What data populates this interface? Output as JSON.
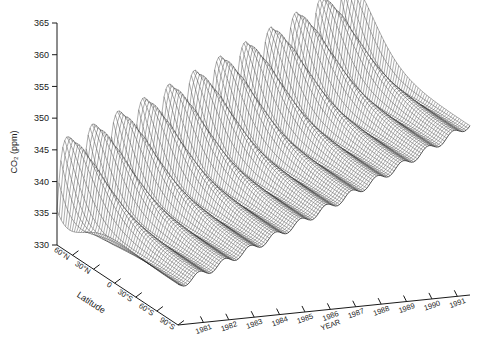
{
  "chart_data": {
    "type": "line",
    "render": "3d-wireframe-surface",
    "title": "",
    "subtitle": "",
    "zlabel": "CO₂ (ppm)",
    "xlabel": "YEAR",
    "ylabel": "Latitude",
    "zlim": [
      330,
      365
    ],
    "ztick_values": [
      330,
      335,
      340,
      345,
      350,
      355,
      360,
      365
    ],
    "ztick_labels": [
      "330",
      "335",
      "340",
      "345",
      "350",
      "355",
      "360",
      "365"
    ],
    "xtick_values": [
      1981,
      1982,
      1983,
      1984,
      1985,
      1986,
      1987,
      1988,
      1989,
      1990,
      1991
    ],
    "xtick_labels": [
      "1981",
      "1982",
      "1983",
      "1984",
      "1985",
      "1986",
      "1987",
      "1988",
      "1989",
      "1990",
      "1991"
    ],
    "xlim": [
      1980.0,
      1991.5
    ],
    "ytick_values": [
      60,
      30,
      0,
      -30,
      -60,
      -90
    ],
    "ytick_labels": [
      "60°N",
      "30°N",
      "0",
      "30°S",
      "60°S",
      "90°S"
    ],
    "ylim": [
      82,
      -90
    ],
    "grid": false,
    "legend": false,
    "legend_position": "none",
    "annotations": [],
    "surface_model": {
      "description": "Atmospheric CO2 concentration versus latitude and time; secular trend plus latitude-dependent seasonal cycle.",
      "trend_start_ppm": 337.8,
      "trend_slope_ppm_per_year": 1.55,
      "trend_curvature_ppm_per_year2": 0.022,
      "trend_reference_year": 1980.0,
      "seasonal_amplitude_north_ppm": 7.6,
      "seasonal_amplitude_south_ppm": 0.6,
      "seasonal_amplitude_latitude_power": 2.6,
      "seasonal_phase_north_peak_month": 4.4,
      "seasonal_phase_south_peak_month": 9.8,
      "mean_offset_north_ppm": 2.3,
      "mean_offset_south_ppm": -1.6,
      "harmonic2_amplitude_north_ppm": 1.5,
      "harmonic2_phase_month": 1.2
    },
    "sampling": {
      "latitude_steps": 56,
      "time_steps": 150
    },
    "projection": {
      "origin_x": 178,
      "origin_y": 325,
      "year_axis_dx": 292,
      "year_axis_dy": -30,
      "lat_axis_dx": -121,
      "lat_axis_dy": -80,
      "z_axis_x": 57,
      "z_top_y": 23,
      "z_bottom_y": 245
    },
    "style": {
      "mesh_color": "#111111",
      "background": "#ffffff",
      "axis_color": "#1a1a1a",
      "mesh_line_width": 0.35,
      "face_fill": "#ffffff"
    },
    "notes": [
      "Sawtooth seasonal oscillation largest at high northern latitudes.",
      "Southern hemisphere nearly flat with small out-of-phase cycle.",
      "Overall rise of roughly 1.5 ppm per year across the record."
    ]
  }
}
